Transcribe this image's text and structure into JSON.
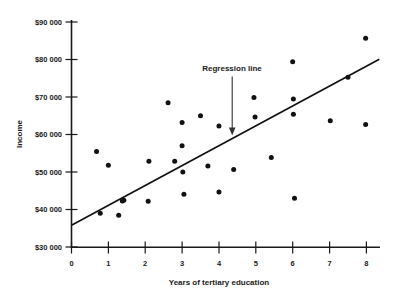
{
  "chart_data": {
    "type": "scatter",
    "title": "",
    "xlabel": "Years of tertiary education",
    "ylabel": "Income",
    "xlim": [
      0,
      8.45
    ],
    "ylim": [
      30000,
      90000
    ],
    "grid": false,
    "legend_position": "none",
    "x_ticks": [
      0,
      1,
      2,
      3,
      4,
      5,
      6,
      7,
      8
    ],
    "x_tick_labels": [
      "0",
      "1",
      "2",
      "3",
      "4",
      "5",
      "6",
      "7",
      "8"
    ],
    "y_ticks": [
      30000,
      40000,
      50000,
      60000,
      70000,
      80000,
      90000
    ],
    "y_tick_labels": [
      "$30 000",
      "$40 000",
      "$50 000",
      "$60 000",
      "$70 000",
      "$80 000",
      "$90 000"
    ],
    "series": [
      {
        "name": "observations",
        "marker": "filled-circle",
        "color": "#111111",
        "points": [
          [
            0.68,
            55500
          ],
          [
            0.78,
            39000
          ],
          [
            1.0,
            51800
          ],
          [
            1.28,
            38500
          ],
          [
            1.38,
            42300
          ],
          [
            1.42,
            42500
          ],
          [
            2.08,
            42200
          ],
          [
            2.1,
            52900
          ],
          [
            2.62,
            68500
          ],
          [
            2.8,
            52900
          ],
          [
            3.0,
            63200
          ],
          [
            3.0,
            57000
          ],
          [
            3.02,
            50000
          ],
          [
            3.05,
            44100
          ],
          [
            3.5,
            65000
          ],
          [
            3.7,
            51600
          ],
          [
            4.0,
            62300
          ],
          [
            4.0,
            44700
          ],
          [
            4.4,
            50700
          ],
          [
            4.95,
            69900
          ],
          [
            4.98,
            64700
          ],
          [
            5.42,
            53900
          ],
          [
            6.0,
            79400
          ],
          [
            6.02,
            69500
          ],
          [
            6.02,
            65400
          ],
          [
            6.05,
            43000
          ],
          [
            7.02,
            63700
          ],
          [
            7.5,
            75300
          ],
          [
            7.98,
            85700
          ],
          [
            7.98,
            62700
          ]
        ]
      }
    ],
    "regression_line": {
      "label": "Regression line",
      "x_start": 0.0,
      "y_start": 35800,
      "x_end": 8.35,
      "y_end": 80100
    },
    "annotations": [
      {
        "text": "Regression line",
        "arrow": true,
        "arrow_target_x": 4.42,
        "arrow_target_y": 60200
      }
    ]
  }
}
